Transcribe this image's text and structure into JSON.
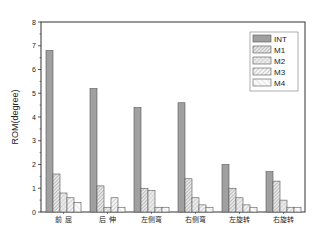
{
  "chart_data": {
    "type": "bar",
    "title": "",
    "xlabel": "",
    "ylabel": "ROM(degree)",
    "ylim": [
      0,
      8
    ],
    "yticks": [
      0,
      1,
      2,
      3,
      4,
      5,
      6,
      7,
      8
    ],
    "grid": false,
    "legend_position": "upper right",
    "categories": [
      "前 屈",
      "后 伸",
      "左侧弯",
      "右侧弯",
      "左旋转",
      "右旋转"
    ],
    "series": [
      {
        "name": "INT",
        "values": [
          6.8,
          5.2,
          4.4,
          4.6,
          2.0,
          1.7
        ],
        "fill": "#a0a0a0",
        "pattern": "solid"
      },
      {
        "name": "M1",
        "values": [
          1.6,
          1.1,
          1.0,
          1.4,
          1.0,
          1.3
        ],
        "fill": "#e0e0e0",
        "pattern": "dense-hatch"
      },
      {
        "name": "M2",
        "values": [
          0.8,
          0.2,
          0.9,
          0.6,
          0.6,
          0.5
        ],
        "fill": "#ececec",
        "pattern": "cross-hatch"
      },
      {
        "name": "M3",
        "values": [
          0.6,
          0.6,
          0.2,
          0.3,
          0.3,
          0.2
        ],
        "fill": "#f2f2f2",
        "pattern": "diag-hatch"
      },
      {
        "name": "M4",
        "values": [
          0.4,
          0.2,
          0.2,
          0.2,
          0.2,
          0.2
        ],
        "fill": "#f8f8f8",
        "pattern": "light-hatch"
      }
    ]
  }
}
